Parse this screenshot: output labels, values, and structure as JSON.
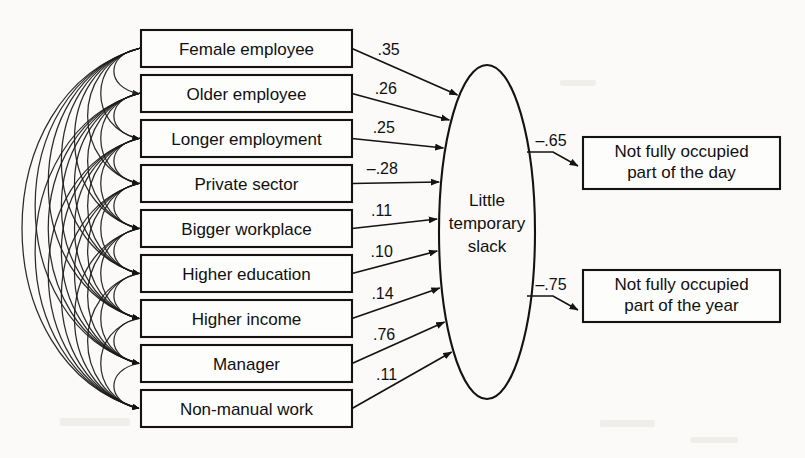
{
  "diagram": {
    "type": "structural-equation-path-diagram",
    "title": "",
    "background_color": "#fbfaf8",
    "line_color": "#131313",
    "indicators": [
      {
        "id": "female-employee",
        "label": "Female employee",
        "coefficient": ".35"
      },
      {
        "id": "older-employee",
        "label": "Older employee",
        "coefficient": ".26"
      },
      {
        "id": "longer-employment",
        "label": "Longer employment",
        "coefficient": ".25"
      },
      {
        "id": "private-sector",
        "label": "Private sector",
        "coefficient": "–.28"
      },
      {
        "id": "bigger-workplace",
        "label": "Bigger workplace",
        "coefficient": ".11"
      },
      {
        "id": "higher-education",
        "label": "Higher education",
        "coefficient": ".10"
      },
      {
        "id": "higher-income",
        "label": "Higher income",
        "coefficient": ".14"
      },
      {
        "id": "manager",
        "label": "Manager",
        "coefficient": ".76"
      },
      {
        "id": "non-manual-work",
        "label": "Non-manual work",
        "coefficient": ".11"
      }
    ],
    "latent": {
      "id": "little-temporary-slack",
      "lines": [
        "Little",
        "temporary",
        "slack"
      ]
    },
    "outcomes": [
      {
        "id": "not-fully-occupied-day",
        "lines": [
          "Not fully occupied",
          "part of the day"
        ],
        "coefficient": "–.65"
      },
      {
        "id": "not-fully-occupied-year",
        "lines": [
          "Not fully occupied",
          "part of the year"
        ],
        "coefficient": "–.75"
      }
    ],
    "correlations_note": "double-headed curved arcs among all nine exogenous indicators"
  }
}
